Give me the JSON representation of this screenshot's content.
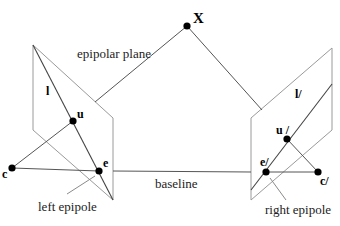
{
  "title_cropped": "",
  "labels": {
    "world_point": "X",
    "epipolar_plane": "epipolar plane",
    "baseline": "baseline",
    "left_epipole": "left epipole",
    "right_epipole": "right epipole",
    "left_line": "l",
    "right_line": "l/",
    "left_image_point": "u",
    "right_image_point": "u /",
    "left_epipole_point": "e",
    "right_epipole_point": "e/",
    "left_center": "c",
    "right_center": "c/"
  },
  "colors": {
    "plane": "#9a9a9a",
    "lines": "#555555",
    "points": "#000000",
    "background": "#ffffff"
  }
}
